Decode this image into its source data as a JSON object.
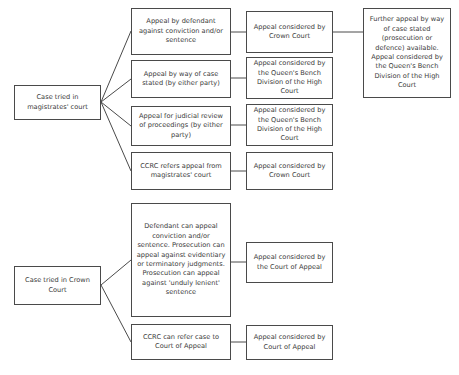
{
  "diagram": {
    "text_color": "#3a3a3a",
    "border_color": "#4a4a4a",
    "background_color": "#ffffff",
    "nodes": [
      {
        "id": "magistrates-origin",
        "label": "Case tried in magistrates' court",
        "x": 14,
        "y": 85,
        "w": 87,
        "h": 35
      },
      {
        "id": "mag-route-defendant-appeal",
        "label": "Appeal by defendant against conviction and/or sentence",
        "x": 131,
        "y": 8,
        "w": 100,
        "h": 47
      },
      {
        "id": "mag-route-case-stated",
        "label": "Appeal by way of case stated (by either party)",
        "x": 131,
        "y": 60,
        "w": 100,
        "h": 38
      },
      {
        "id": "mag-route-judicial-review",
        "label": "Appeal for judicial review of proceedings (by either party)",
        "x": 131,
        "y": 106,
        "w": 100,
        "h": 40
      },
      {
        "id": "mag-route-ccrc",
        "label": "CCRC refers appeal from magistrates' court",
        "x": 131,
        "y": 152,
        "w": 100,
        "h": 38
      },
      {
        "id": "mag-outcome-crown-court-1",
        "label": "Appeal considered by Crown Court",
        "x": 246,
        "y": 11,
        "w": 87,
        "h": 42
      },
      {
        "id": "mag-outcome-qbd-1",
        "label": "Appeal considered by the Queen's Bench Division of the High Court",
        "x": 246,
        "y": 57,
        "w": 87,
        "h": 42
      },
      {
        "id": "mag-outcome-qbd-2",
        "label": "Appeal considered by the Queen's Bench Division of the High Court",
        "x": 246,
        "y": 104,
        "w": 87,
        "h": 42
      },
      {
        "id": "mag-outcome-crown-court-2",
        "label": "Appeal considered by Crown Court",
        "x": 246,
        "y": 152,
        "w": 87,
        "h": 38
      },
      {
        "id": "further-appeal-qbd",
        "label": "Further appeal by way of case stated (prosecution or defence) available. Appeal considered by the Queen's Bench Division of the High Court",
        "x": 363,
        "y": 8,
        "w": 88,
        "h": 90
      },
      {
        "id": "crown-origin",
        "label": "Case tried in Crown Court",
        "x": 14,
        "y": 266,
        "w": 87,
        "h": 39
      },
      {
        "id": "crown-route-appeals",
        "label": "Defendant can appeal conviction and/or sentence. Prosecution can appeal against evidentiary or terminatory judgments. Prosecution can appeal against 'unduly lenient' sentence",
        "x": 131,
        "y": 203,
        "w": 100,
        "h": 114
      },
      {
        "id": "crown-route-ccrc",
        "label": "CCRC can refer case to Court of Appeal",
        "x": 131,
        "y": 324,
        "w": 100,
        "h": 36
      },
      {
        "id": "crown-outcome-court-of-appeal-1",
        "label": "Appeal considered by the Court of Appeal",
        "x": 246,
        "y": 242,
        "w": 87,
        "h": 41
      },
      {
        "id": "crown-outcome-court-of-appeal-2",
        "label": "Appeal considered by Court of Appeal",
        "x": 246,
        "y": 325,
        "w": 87,
        "h": 35
      }
    ],
    "connectors": [
      {
        "id": "mag-to-defendant-appeal",
        "points": "101,102 131,31"
      },
      {
        "id": "mag-to-case-stated",
        "points": "101,102 131,79"
      },
      {
        "id": "mag-to-judicial-review",
        "points": "101,102 131,126"
      },
      {
        "id": "mag-to-ccrc",
        "points": "101,102 131,171"
      },
      {
        "id": "defendant-appeal-to-crown-court",
        "points": "231,32 246,32"
      },
      {
        "id": "case-stated-to-qbd",
        "points": "231,78 246,78"
      },
      {
        "id": "judicial-review-to-qbd",
        "points": "231,125 246,125"
      },
      {
        "id": "ccrc-to-crown-court",
        "points": "231,171 246,171"
      },
      {
        "id": "crown-court-to-further-appeal",
        "points": "333,32 363,32"
      },
      {
        "id": "crown-origin-to-appeals",
        "points": "101,285 131,260"
      },
      {
        "id": "crown-origin-to-ccrc",
        "points": "101,285 131,342"
      },
      {
        "id": "appeals-to-court-of-appeal",
        "points": "231,262 246,262"
      },
      {
        "id": "ccrc-to-court-of-appeal",
        "points": "231,342 246,342"
      }
    ]
  }
}
